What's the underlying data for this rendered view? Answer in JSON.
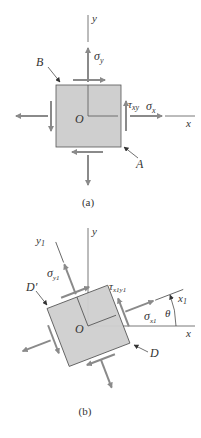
{
  "figure": {
    "panel_a": {
      "caption": "(a)",
      "axis_x_label": "x",
      "axis_y_label": "y",
      "origin_label": "O",
      "sigma_x_label": "σ",
      "sigma_x_sub": "x",
      "sigma_y_label": "σ",
      "sigma_y_sub": "y",
      "tau_label": "τ",
      "tau_sub": "xy",
      "point_a_label": "A",
      "point_b_label": "B"
    },
    "panel_b": {
      "caption": "(b)",
      "axis_x_label": "x",
      "axis_y_label": "y",
      "axis_x1_label": "x",
      "axis_x1_sub": "1",
      "axis_y1_label": "y",
      "axis_y1_sub": "1",
      "origin_label": "O",
      "sigma_x1_label": "σ",
      "sigma_x1_sub": "x1",
      "sigma_y1_label": "σ",
      "sigma_y1_sub": "y1",
      "tau_label": "τ",
      "tau_sub": "x1y1",
      "theta_label": "θ",
      "point_d_label": "D",
      "point_dprime_label": "D′",
      "rotation_deg": 21
    },
    "colors": {
      "element_fill": "#cfcfcf",
      "element_stroke": "#555555",
      "arrow": "#8a8a8a",
      "axis": "#555555",
      "text": "#333333"
    }
  }
}
